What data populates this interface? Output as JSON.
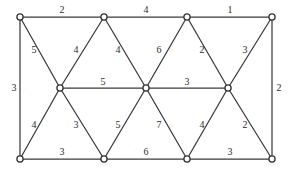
{
  "figure": {
    "name": "weighted-graph-diagram",
    "width": 293,
    "height": 176,
    "background_color": "#ffffff",
    "edge_color": "#3b3b3b",
    "node_fill_color": "#ffffff",
    "node_stroke_color": "#333333",
    "label_color": "#2b2b2b"
  },
  "graph": {
    "type": "weighted-undirected-graph",
    "vertices": [
      {
        "id": "t1",
        "x": 20,
        "y": 17,
        "row": "top",
        "col": 1
      },
      {
        "id": "t2",
        "x": 104,
        "y": 17,
        "row": "top",
        "col": 2
      },
      {
        "id": "t3",
        "x": 187,
        "y": 17,
        "row": "top",
        "col": 3
      },
      {
        "id": "t4",
        "x": 272,
        "y": 17,
        "row": "top",
        "col": 4
      },
      {
        "id": "m1",
        "x": 60,
        "y": 88,
        "row": "middle",
        "col": 1
      },
      {
        "id": "m2",
        "x": 146,
        "y": 88,
        "row": "middle",
        "col": 2
      },
      {
        "id": "m3",
        "x": 228,
        "y": 88,
        "row": "middle",
        "col": 3
      },
      {
        "id": "b1",
        "x": 20,
        "y": 159,
        "row": "bottom",
        "col": 1
      },
      {
        "id": "b2",
        "x": 104,
        "y": 159,
        "row": "bottom",
        "col": 2
      },
      {
        "id": "b3",
        "x": 187,
        "y": 159,
        "row": "bottom",
        "col": 3
      },
      {
        "id": "b4",
        "x": 272,
        "y": 159,
        "row": "bottom",
        "col": 4
      }
    ],
    "edges": [
      {
        "id": "e-t1-t2",
        "from": "t1",
        "to": "t2",
        "weight": "2",
        "label_x": 62,
        "label_y": 10
      },
      {
        "id": "e-t2-t3",
        "from": "t2",
        "to": "t3",
        "weight": "4",
        "label_x": 146,
        "label_y": 10
      },
      {
        "id": "e-t3-t4",
        "from": "t3",
        "to": "t4",
        "weight": "1",
        "label_x": 230,
        "label_y": 10
      },
      {
        "id": "e-t1-b1",
        "from": "t1",
        "to": "b1",
        "weight": "3",
        "label_x": 14,
        "label_y": 88
      },
      {
        "id": "e-t4-b4",
        "from": "t4",
        "to": "b4",
        "weight": "2",
        "label_x": 279,
        "label_y": 88
      },
      {
        "id": "e-t1-m1",
        "from": "t1",
        "to": "m1",
        "weight": "5",
        "label_x": 34,
        "label_y": 50
      },
      {
        "id": "e-m1-t2",
        "from": "m1",
        "to": "t2",
        "weight": "4",
        "label_x": 76,
        "label_y": 50
      },
      {
        "id": "e-t2-m2",
        "from": "t2",
        "to": "m2",
        "weight": "4",
        "label_x": 118,
        "label_y": 50
      },
      {
        "id": "e-m2-t3",
        "from": "m2",
        "to": "t3",
        "weight": "6",
        "label_x": 159,
        "label_y": 50
      },
      {
        "id": "e-t3-m3",
        "from": "t3",
        "to": "m3",
        "weight": "2",
        "label_x": 202,
        "label_y": 50
      },
      {
        "id": "e-m3-t4",
        "from": "m3",
        "to": "t4",
        "weight": "3",
        "label_x": 245,
        "label_y": 50
      },
      {
        "id": "e-m1-m2",
        "from": "m1",
        "to": "m2",
        "weight": "5",
        "label_x": 103,
        "label_y": 82
      },
      {
        "id": "e-m2-m3",
        "from": "m2",
        "to": "m3",
        "weight": "3",
        "label_x": 187,
        "label_y": 82
      },
      {
        "id": "e-b1-m1",
        "from": "b1",
        "to": "m1",
        "weight": "4",
        "label_x": 34,
        "label_y": 125
      },
      {
        "id": "e-m1-b2",
        "from": "m1",
        "to": "b2",
        "weight": "3",
        "label_x": 76,
        "label_y": 125
      },
      {
        "id": "e-b2-m2",
        "from": "b2",
        "to": "m2",
        "weight": "5",
        "label_x": 118,
        "label_y": 125
      },
      {
        "id": "e-m2-b3",
        "from": "m2",
        "to": "b3",
        "weight": "7",
        "label_x": 159,
        "label_y": 125
      },
      {
        "id": "e-b3-m3",
        "from": "b3",
        "to": "m3",
        "weight": "4",
        "label_x": 202,
        "label_y": 125
      },
      {
        "id": "e-m3-b4",
        "from": "m3",
        "to": "b4",
        "weight": "2",
        "label_x": 245,
        "label_y": 125
      },
      {
        "id": "e-b1-b2",
        "from": "b1",
        "to": "b2",
        "weight": "3",
        "label_x": 62,
        "label_y": 152
      },
      {
        "id": "e-b2-b3",
        "from": "b2",
        "to": "b3",
        "weight": "6",
        "label_x": 146,
        "label_y": 152
      },
      {
        "id": "e-b3-b4",
        "from": "b3",
        "to": "b4",
        "weight": "3",
        "label_x": 230,
        "label_y": 152
      }
    ]
  }
}
